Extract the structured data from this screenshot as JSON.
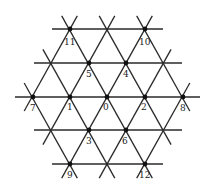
{
  "diagram": {
    "type": "triangular-lattice",
    "line_color": "#2a2a2a",
    "dot_color": "#111111",
    "center": [
      107,
      97
    ],
    "dx": 37.5,
    "dy": 33.6,
    "horizontal_lines": [
      {
        "y": 29,
        "x1": 52,
        "x2": 163
      },
      {
        "y": 63,
        "x1": 34,
        "x2": 182
      },
      {
        "y": 97,
        "x1": 15,
        "x2": 200
      },
      {
        "y": 130,
        "x1": 34,
        "x2": 182
      },
      {
        "y": 164,
        "x1": 52,
        "x2": 163
      }
    ],
    "nodes": [
      {
        "id": "0",
        "x": 107,
        "y": 97,
        "lx": 103,
        "ly": 110
      },
      {
        "id": "1",
        "x": 70,
        "y": 97,
        "lx": 67,
        "ly": 110
      },
      {
        "id": "2",
        "x": 145,
        "y": 97,
        "lx": 141,
        "ly": 110
      },
      {
        "id": "3",
        "x": 89,
        "y": 130,
        "lx": 86,
        "ly": 144
      },
      {
        "id": "4",
        "x": 126,
        "y": 63,
        "lx": 123,
        "ly": 77
      },
      {
        "id": "5",
        "x": 89,
        "y": 63,
        "lx": 86,
        "ly": 77
      },
      {
        "id": "6",
        "x": 126,
        "y": 130,
        "lx": 122,
        "ly": 144
      },
      {
        "id": "7",
        "x": 33,
        "y": 97,
        "lx": 30,
        "ly": 111
      },
      {
        "id": "8",
        "x": 183,
        "y": 97,
        "lx": 180,
        "ly": 111
      },
      {
        "id": "9",
        "x": 70,
        "y": 164,
        "lx": 67,
        "ly": 178
      },
      {
        "id": "10",
        "x": 145,
        "y": 29,
        "lx": 139,
        "ly": 45
      },
      {
        "id": "11",
        "x": 70,
        "y": 29,
        "lx": 64,
        "ly": 45
      },
      {
        "id": "12",
        "x": 145,
        "y": 164,
        "lx": 139,
        "ly": 178
      }
    ]
  }
}
